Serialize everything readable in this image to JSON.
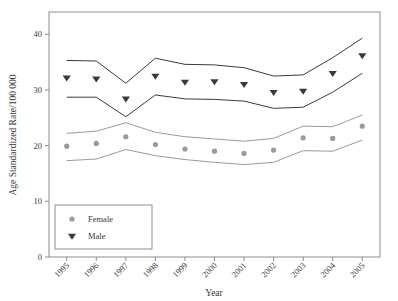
{
  "chart_data": {
    "type": "line",
    "title": "",
    "xlabel": "Year",
    "ylabel": "Age Standardized Rate/100 000",
    "x": [
      1995,
      1996,
      1997,
      1998,
      1999,
      2000,
      2001,
      2002,
      2003,
      2004,
      2005
    ],
    "categories": [
      "1995",
      "1996",
      "1997",
      "1998",
      "1999",
      "2000",
      "2001",
      "2002",
      "2003",
      "2004",
      "2005"
    ],
    "xlim": [
      1994.4,
      2005.6
    ],
    "ylim": [
      0,
      44
    ],
    "yticks": [
      0,
      10,
      20,
      30,
      40
    ],
    "ytick_labels": [
      "0",
      "10",
      "20",
      "30",
      "40"
    ],
    "xticks": [
      1995,
      1996,
      1997,
      1998,
      1999,
      2000,
      2001,
      2002,
      2003,
      2004,
      2005
    ],
    "grid": false,
    "legend_position": "lower-left",
    "series": [
      {
        "name": "Male",
        "marker": "triangle-down",
        "color": "#3a3a3a",
        "values": [
          32.2,
          32.0,
          28.4,
          32.5,
          31.4,
          31.5,
          31.0,
          29.6,
          29.8,
          33.0,
          36.2
        ],
        "ci_upper": [
          35.3,
          35.2,
          31.2,
          35.7,
          34.6,
          34.5,
          34.0,
          32.5,
          32.7,
          35.8,
          39.3
        ],
        "ci_lower": [
          28.7,
          28.7,
          25.2,
          29.1,
          28.4,
          28.3,
          28.0,
          26.7,
          26.9,
          29.6,
          33.0
        ]
      },
      {
        "name": "Female",
        "marker": "circle",
        "color": "#9a9a9a",
        "values": [
          19.9,
          20.4,
          21.6,
          20.2,
          19.4,
          19.0,
          18.6,
          19.2,
          21.4,
          21.3,
          23.5
        ],
        "ci_upper": [
          22.2,
          22.6,
          24.1,
          22.4,
          21.6,
          21.2,
          20.8,
          21.3,
          23.5,
          23.4,
          25.5
        ],
        "ci_lower": [
          17.3,
          17.6,
          19.3,
          18.2,
          17.5,
          17.0,
          16.6,
          17.0,
          19.1,
          19.0,
          21.0
        ]
      }
    ]
  },
  "legend": {
    "entries": [
      {
        "label": "Female",
        "marker": "circle"
      },
      {
        "label": "Male",
        "marker": "triangle-down"
      }
    ]
  },
  "axes": {
    "y_title": "Age Standardized Rate/100 000",
    "x_title": "Year"
  }
}
